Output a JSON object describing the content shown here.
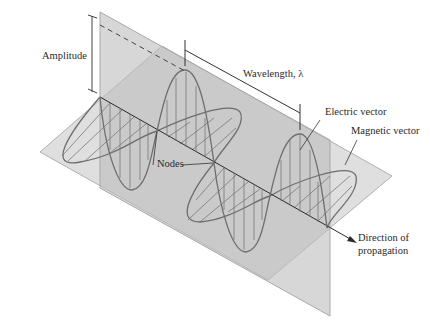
{
  "figure": {
    "labels": {
      "amplitude": "Amplitude",
      "wavelength": "Wavelength, λ",
      "electric_vector": "Electric vector",
      "magnetic_vector": "Magnetic vector",
      "nodes": "Nodes",
      "direction_line1": "Direction of",
      "direction_line2": "propagation"
    },
    "colors": {
      "plane_fill": "#c8c8c8",
      "plane_edge": "#a8a8a8",
      "wave_stroke": "#6e6e6e",
      "axis": "#2a2a2a",
      "text": "#2a2a2a"
    }
  }
}
